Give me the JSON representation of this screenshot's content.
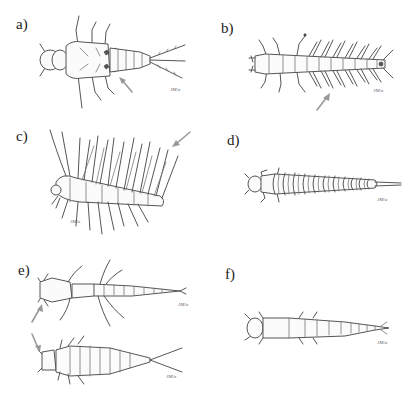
{
  "figure": {
    "panels": [
      {
        "id": "a",
        "label": "a)",
        "subject": "larva with abdominal gill plates and three caudal filaments",
        "signature": "JM/a"
      },
      {
        "id": "b",
        "label": "b)",
        "subject": "larva with paired lateral abdominal filaments",
        "signature": "JM/a"
      },
      {
        "id": "c",
        "label": "c)",
        "subject": "lateral view of larva with long filamentous gills",
        "signature": "JM/a"
      },
      {
        "id": "d",
        "label": "d)",
        "subject": "segmented larva with lateral lobes and terminal process",
        "signature": "JM/a"
      },
      {
        "id": "e",
        "label": "e)",
        "subject": "two larvae with tracheal gills, arrows indicating head region",
        "signature": "JM/a"
      },
      {
        "id": "f",
        "label": "f)",
        "subject": "elongate segmented larva",
        "signature": "JM/a"
      }
    ],
    "arrow_color": "#999999",
    "line_color": "#555555"
  }
}
